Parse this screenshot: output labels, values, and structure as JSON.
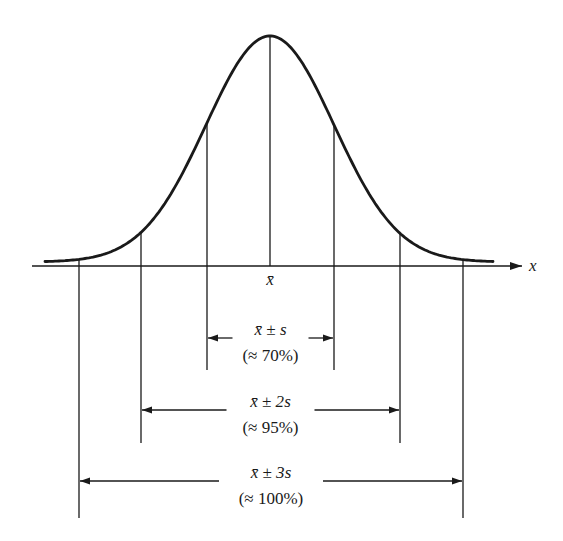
{
  "diagram": {
    "axis": {
      "label": "x",
      "mean_label": "x̄"
    },
    "colors": {
      "ink": "#1a1a1a",
      "background": "#ffffff"
    },
    "curve": {
      "center_px": 270,
      "sigma_px": 64,
      "peak_y_px": 36,
      "baseline_y_px": 262,
      "x_start_px": 45,
      "x_end_px": 494
    },
    "intervals": [
      {
        "id": "1s",
        "formula_main": "x̄ ± ",
        "formula_var": "s",
        "percent": "(≈ 70%)",
        "left_px": 207,
        "right_px": 334,
        "arrow_y_px": 338,
        "line_bottom_px": 370
      },
      {
        "id": "2s",
        "formula_main": "x̄ ± 2",
        "formula_var": "s",
        "percent": "(≈ 95%)",
        "left_px": 141,
        "right_px": 400,
        "arrow_y_px": 410,
        "line_bottom_px": 443
      },
      {
        "id": "3s",
        "formula_main": "x̄ ± 3",
        "formula_var": "s",
        "percent": "(≈ 100%)",
        "left_px": 79,
        "right_px": 463,
        "arrow_y_px": 481,
        "line_bottom_px": 518
      }
    ]
  }
}
